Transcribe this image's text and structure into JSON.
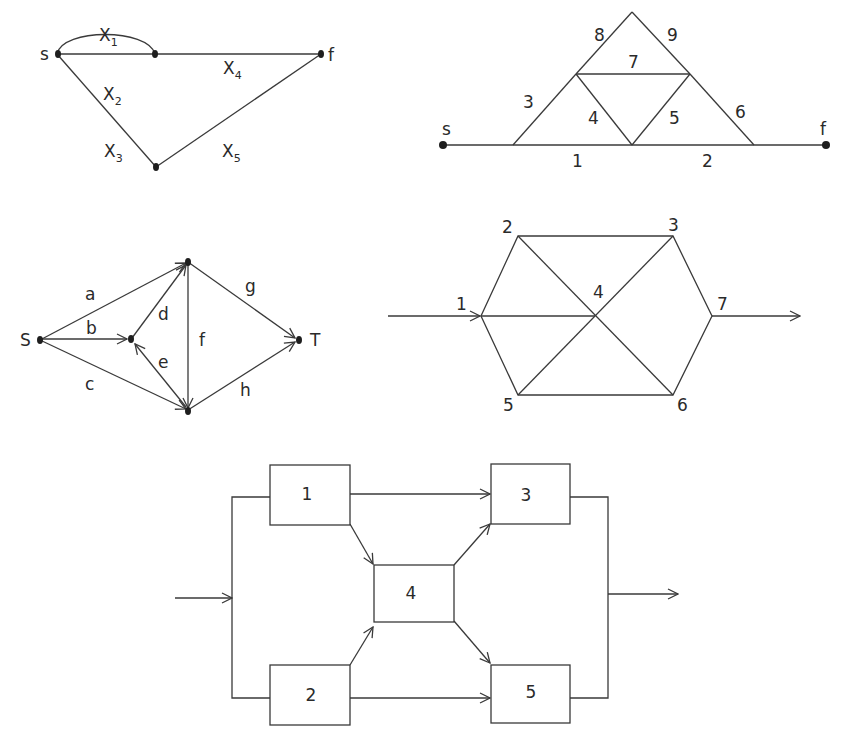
{
  "diagram1": {
    "title": "Bridge-like network with edges X1..X5",
    "nodes": {
      "source": "s",
      "sink": "f"
    },
    "edges": [
      {
        "id": "x1",
        "label": "X",
        "sub": "1"
      },
      {
        "id": "x2",
        "label": "X",
        "sub": "2"
      },
      {
        "id": "x3",
        "label": "X",
        "sub": "3"
      },
      {
        "id": "x4",
        "label": "X",
        "sub": "4"
      },
      {
        "id": "x5",
        "label": "X",
        "sub": "5"
      }
    ]
  },
  "diagram2": {
    "title": "Triangular network with edges 1..9",
    "nodes": {
      "source": "s",
      "sink": "f"
    },
    "edge_labels": [
      "1",
      "2",
      "3",
      "4",
      "5",
      "6",
      "7",
      "8",
      "9"
    ]
  },
  "diagram3": {
    "title": "Directed network S to T",
    "nodes": {
      "source": "S",
      "sink": "T"
    },
    "edge_labels": [
      "a",
      "b",
      "c",
      "d",
      "e",
      "f",
      "g",
      "h"
    ]
  },
  "diagram4": {
    "title": "Hexagonal network nodes 1..7",
    "node_labels": [
      "1",
      "2",
      "3",
      "4",
      "5",
      "6",
      "7"
    ]
  },
  "diagram5": {
    "title": "Block diagram with five components",
    "block_labels": [
      "1",
      "2",
      "3",
      "4",
      "5"
    ]
  }
}
